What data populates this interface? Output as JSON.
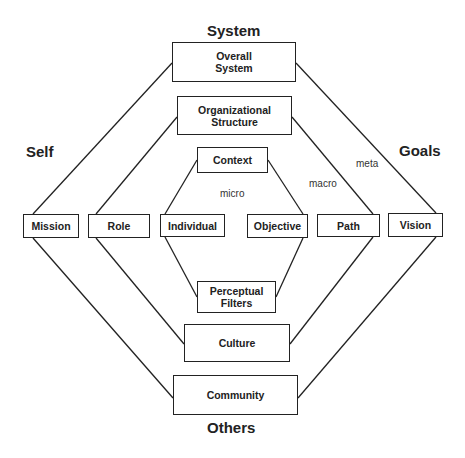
{
  "diagram": {
    "corner_labels": {
      "top": "System",
      "left": "Self",
      "right": "Goals",
      "bottom": "Others"
    },
    "level_labels": {
      "micro": "micro",
      "macro": "macro",
      "meta": "meta"
    },
    "boxes": {
      "overall_system": "Overall System",
      "organizational_structure": "Organizational Structure",
      "context": "Context",
      "mission": "Mission",
      "role": "Role",
      "individual": "Individual",
      "objective": "Objective",
      "path": "Path",
      "vision": "Vision",
      "perceptual_filters": "Perceptual Filters",
      "culture": "Culture",
      "community": "Community"
    },
    "rings": [
      {
        "name": "meta",
        "left": "Mission",
        "top": "Overall System",
        "right": "Vision",
        "bottom": "Community"
      },
      {
        "name": "macro",
        "left": "Role",
        "top": "Organizational Structure",
        "right": "Path",
        "bottom": "Culture"
      },
      {
        "name": "micro",
        "left": "Individual",
        "top": "Context",
        "right": "Objective",
        "bottom": "Perceptual Filters"
      }
    ],
    "line_color": "#222222"
  }
}
